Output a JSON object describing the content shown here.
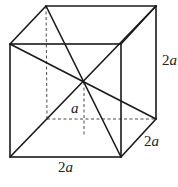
{
  "diagram": {
    "type": "cube-with-space-diagonals",
    "vertices": {
      "front_top_left": [
        10,
        44
      ],
      "front_top_right": [
        121,
        44
      ],
      "front_bottom_left": [
        10,
        157
      ],
      "front_bottom_right": [
        121,
        157
      ],
      "back_top_left": [
        46,
        6
      ],
      "back_top_right": [
        156,
        6
      ],
      "back_bottom_right": [
        156,
        119
      ],
      "back_bottom_left": [
        47,
        119
      ]
    },
    "center": [
      84,
      82
    ],
    "bottom_face_center": [
      84,
      135
    ]
  },
  "labels": {
    "height": {
      "num": "2",
      "var": "a"
    },
    "depth": {
      "num": "2",
      "var": "a"
    },
    "width": {
      "num": "2",
      "var": "a"
    },
    "half_height": {
      "num": "",
      "var": "a"
    }
  }
}
